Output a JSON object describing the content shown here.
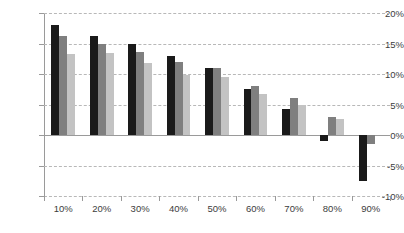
{
  "chart_data": {
    "type": "bar",
    "title": "",
    "subtitle": "",
    "xlabel": "",
    "ylabel": "",
    "categories": [
      "10%",
      "20%",
      "30%",
      "40%",
      "50%",
      "60%",
      "70%",
      "80%",
      "90%"
    ],
    "series": [
      {
        "name": "series-1",
        "color": "#1a1a1a",
        "values": [
          18.0,
          16.3,
          15.0,
          13.0,
          11.0,
          7.5,
          4.2,
          -1.0,
          -7.5
        ]
      },
      {
        "name": "series-2",
        "color": "#7f7f7f",
        "values": [
          16.3,
          15.0,
          13.6,
          12.0,
          11.0,
          8.0,
          6.0,
          3.0,
          -1.5
        ]
      },
      {
        "name": "series-3",
        "color": "#c3c3c3",
        "values": [
          13.3,
          13.5,
          11.8,
          9.8,
          9.5,
          6.8,
          5.0,
          2.7,
          0.0
        ]
      }
    ],
    "ylim": [
      -10,
      20
    ],
    "ytick_values": [
      20,
      15,
      10,
      5,
      0,
      -5,
      -10
    ],
    "ytick_labels": [
      "20%",
      "15%",
      "10%",
      "5%",
      "0%",
      "-5%",
      "-10%"
    ],
    "grid": true,
    "legend": false,
    "legend_position": "none",
    "zero_line": 0
  }
}
